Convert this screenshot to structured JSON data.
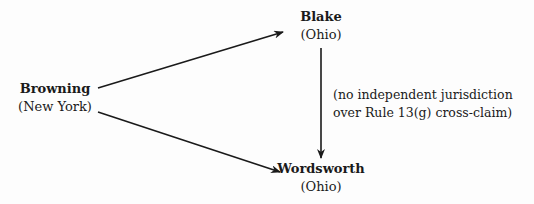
{
  "diagram": {
    "nodes": [
      {
        "id": "browning",
        "name": "Browning",
        "state": "(New York)"
      },
      {
        "id": "blake",
        "name": "Blake",
        "state": "(Ohio)"
      },
      {
        "id": "wordsworth",
        "name": "Wordsworth",
        "state": "(Ohio)"
      }
    ],
    "edges": [
      {
        "from": "browning",
        "to": "blake"
      },
      {
        "from": "browning",
        "to": "wordsworth"
      },
      {
        "from": "blake",
        "to": "wordsworth",
        "label": "(no independent jurisdiction over Rule 13(g) cross-claim)"
      }
    ],
    "annotation": {
      "line1": "(no independent jurisdiction",
      "line2": "over Rule 13(g) cross-claim)"
    },
    "colors": {
      "ink": "#1a1a1a",
      "background": "#fdfdfd"
    }
  }
}
